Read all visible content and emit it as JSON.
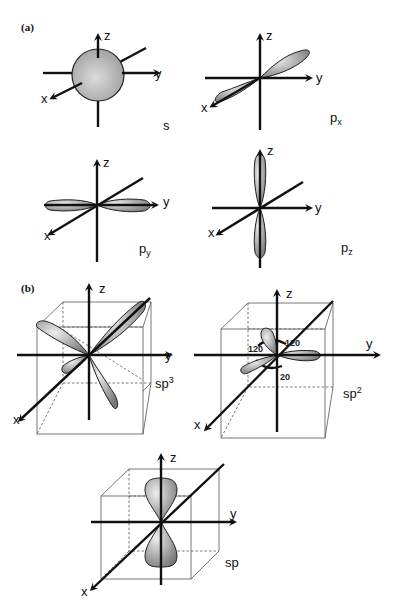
{
  "figure": {
    "panels": [
      {
        "id": "a",
        "label": "(a)"
      },
      {
        "id": "b",
        "label": "(b)"
      }
    ],
    "axis_labels": {
      "x": "x",
      "y": "y",
      "z": "z"
    },
    "orbitals": {
      "s": {
        "label": "s"
      },
      "px": {
        "label": "p",
        "sub": "x"
      },
      "py": {
        "label": "p",
        "sub": "y"
      },
      "pz": {
        "label": "p",
        "sub": "z"
      },
      "sp3": {
        "label": "sp",
        "sup": "3"
      },
      "sp2": {
        "label": "sp",
        "sup": "2",
        "angles": [
          "120",
          "120",
          "20"
        ]
      },
      "sp": {
        "label": "sp"
      }
    },
    "colors": {
      "lobe_light": "#e6e6e6",
      "lobe_dark": "#7a7a7a",
      "axis": "#111111"
    }
  }
}
